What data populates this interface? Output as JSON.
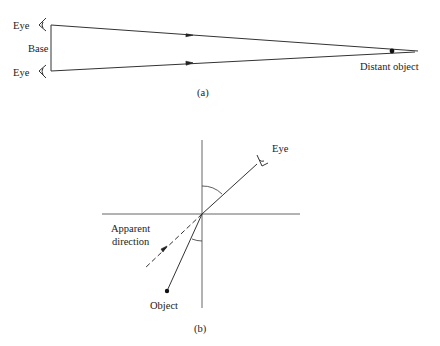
{
  "panel_a": {
    "caption": "(a)",
    "labels": {
      "eye_top": "Eye",
      "eye_bottom": "Eye",
      "base": "Base",
      "distant_object": "Distant object"
    }
  },
  "panel_b": {
    "caption": "(b)",
    "labels": {
      "eye": "Eye",
      "apparent_direction_line1": "Apparent",
      "apparent_direction_line2": "direction",
      "object": "Object"
    }
  },
  "colors": {
    "line": "#333333",
    "text": "#222222"
  }
}
